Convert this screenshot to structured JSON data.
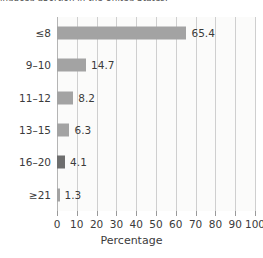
{
  "caption": {
    "text": "induced abortion in the United States."
  },
  "chart_data": {
    "type": "bar",
    "orientation": "horizontal",
    "title": "",
    "categories": [
      "≤8",
      "9–10",
      "11–12",
      "13–15",
      "16–20",
      "≥21"
    ],
    "values": [
      65.4,
      14.7,
      8.2,
      6.3,
      4.1,
      1.3
    ],
    "value_labels": [
      "65.4",
      "14.7",
      "8.2",
      "6.3",
      "4.1",
      "1.3"
    ],
    "bar_colors": [
      "#a3a3a3",
      "#a3a3a3",
      "#a3a3a3",
      "#a3a3a3",
      "#6e6e6e",
      "#a3a3a3"
    ],
    "xlabel": "Percentage",
    "ylabel": "",
    "xlim": [
      0,
      100
    ],
    "xticks": [
      0,
      10,
      20,
      30,
      40,
      50,
      60,
      70,
      80,
      90,
      100
    ],
    "xtick_labels": [
      "0",
      "10",
      "20",
      "30",
      "40",
      "50",
      "60",
      "70",
      "80",
      "90",
      "100"
    ],
    "grid": true,
    "grid_axis": "x",
    "legend": false,
    "plot_background": "#fbfbfa",
    "grid_color": "#cfcfcf",
    "text_color": "#3b3b3b"
  }
}
